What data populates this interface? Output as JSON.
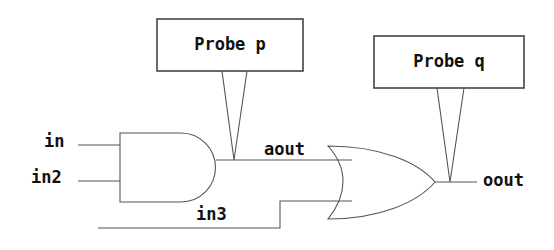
{
  "diagram": {
    "background_color": "#ffffff",
    "line_color": "#555555",
    "text_color": "#111111",
    "signals": {
      "in": "in",
      "in2": "in2",
      "in3": "in3",
      "aout": "aout",
      "oout": "oout"
    },
    "probes": [
      {
        "name": "probe-p",
        "label": "Probe p",
        "attached_to": "aout"
      },
      {
        "name": "probe-q",
        "label": "Probe q",
        "attached_to": "oout"
      }
    ],
    "gates": [
      {
        "name": "and-gate",
        "type": "AND",
        "inputs": [
          "in",
          "in2"
        ],
        "output": "aout"
      },
      {
        "name": "or-gate",
        "type": "OR",
        "inputs": [
          "aout",
          "in3"
        ],
        "output": "oout"
      }
    ]
  }
}
